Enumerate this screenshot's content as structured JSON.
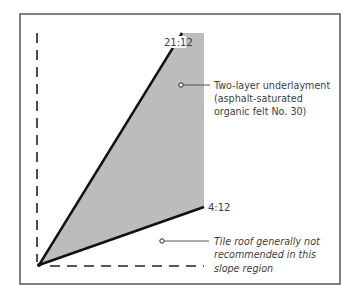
{
  "diagram": {
    "frame": {
      "x": 20,
      "y": 14,
      "width": 320,
      "height": 270,
      "stroke": "#555555"
    },
    "origin": {
      "x": 39,
      "y": 265
    },
    "axes": {
      "vertical": {
        "x": 37,
        "y1": 33,
        "y2": 265,
        "style": "dashed"
      },
      "horizontal": {
        "y": 266,
        "x1": 50,
        "x2": 204,
        "style": "dashed"
      }
    },
    "slopes": [
      {
        "id": "steep",
        "label": "21:12",
        "rise": 21,
        "run": 12,
        "end": {
          "x": 182,
          "y": 33
        }
      },
      {
        "id": "shallow",
        "label": "4:12",
        "rise": 4,
        "run": 12,
        "end": {
          "x": 204,
          "y": 207
        }
      }
    ],
    "region_fill": "#bcbcbc",
    "callouts": [
      {
        "id": "underlayment",
        "marker": {
          "x": 181,
          "y": 85
        },
        "lines": [
          "Two-layer underlayment",
          "(asphalt-saturated",
          "organic felt No. 30)"
        ]
      },
      {
        "id": "not-recommended",
        "marker": {
          "x": 162,
          "y": 241
        },
        "lines": [
          "Tile roof generally not",
          "recommended in this",
          "slope region"
        ]
      }
    ]
  }
}
